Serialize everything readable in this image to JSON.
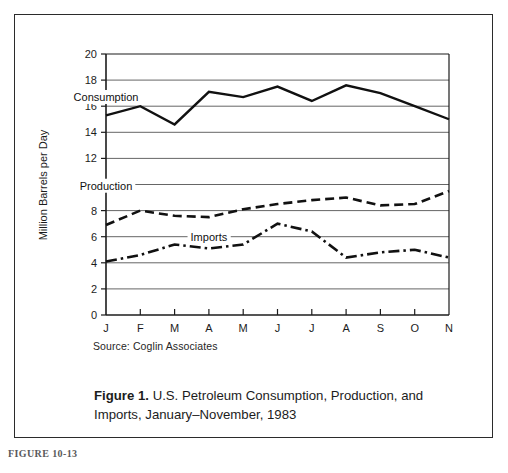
{
  "figure": {
    "figure_number_label": "FIGURE 10-13",
    "caption_strong": "Figure 1.",
    "caption_line1": "U.S. Petroleum Consumption, Production,",
    "caption_line2": "and Imports, January–November, 1983",
    "source_note": "Source:  Coglin Associates"
  },
  "chart_data": {
    "type": "line",
    "title": "",
    "xlabel": "",
    "ylabel": "Million Barrels per Day",
    "categories": [
      "J",
      "F",
      "M",
      "A",
      "M",
      "J",
      "J",
      "A",
      "S",
      "O",
      "N"
    ],
    "category_full": [
      "January",
      "February",
      "March",
      "April",
      "May",
      "June",
      "July",
      "August",
      "September",
      "October",
      "November"
    ],
    "ylim": [
      0,
      20
    ],
    "yticks": [
      0,
      2,
      4,
      6,
      8,
      10,
      12,
      14,
      16,
      18,
      20
    ],
    "gridlines": "horizontal",
    "legend_position": "inline-labels",
    "series": [
      {
        "name": "Consumption",
        "style": "solid",
        "color": "#111111",
        "values": [
          15.3,
          16.0,
          14.6,
          17.1,
          16.7,
          17.5,
          16.4,
          17.6,
          17.0,
          16.0,
          15.0
        ],
        "label_x_category": "J",
        "label_value": 16.4
      },
      {
        "name": "Production",
        "style": "dashed",
        "color": "#111111",
        "values": [
          6.9,
          8.0,
          7.6,
          7.5,
          8.1,
          8.5,
          8.8,
          9.0,
          8.4,
          8.5,
          9.5
        ],
        "label_x_category": "J",
        "label_value": 9.6
      },
      {
        "name": "Imports",
        "style": "dash-dot",
        "color": "#111111",
        "values": [
          4.1,
          4.6,
          5.4,
          5.1,
          5.4,
          7.0,
          6.4,
          4.4,
          4.8,
          5.0,
          4.4
        ],
        "label_x_category": "A",
        "label_value": 5.7
      }
    ]
  }
}
